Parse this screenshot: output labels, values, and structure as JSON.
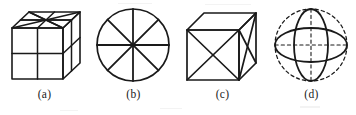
{
  "sheet": {
    "background_color": "#ffffff",
    "ink_color": "#1a1a1a",
    "width": 356,
    "height": 115,
    "description": "Four line-drawn geometry figures in a row, each with a lettered caption below"
  },
  "figures": [
    {
      "id": "figure-a",
      "caption": "(a)",
      "shape_name": "cube-divided-quarters",
      "stroke_color": "#1a1a1a",
      "line_style": "solid",
      "detail": "Cube in oblique projection; front and right faces split into four quadrants; top face crossed by radiating diagonals and median lines"
    },
    {
      "id": "figure-b",
      "caption": "(b)",
      "shape_name": "circle-eight-sectors",
      "stroke_color": "#1a1a1a",
      "line_style": "solid",
      "detail": "Circle divided into eight equal sectors by four diameters at 0, 45, 90 and 135 degrees"
    },
    {
      "id": "figure-c",
      "caption": "(c)",
      "shape_name": "cube-face-diagonals",
      "stroke_color": "#1a1a1a",
      "line_style": "solid",
      "detail": "Cube in oblique projection with crossed diagonals drawn on the front face and on the right side face"
    },
    {
      "id": "figure-d",
      "caption": "(d)",
      "shape_name": "sphere-two-great-circles",
      "stroke_color": "#1a1a1a",
      "line_style": "solid outline of lenses, dashed sphere outline and dashed axes",
      "detail": "Sphere drawn as a dashed circle with a solid vertical lens and a solid horizontal lens, plus dashed vertical and horizontal centre axes"
    }
  ]
}
